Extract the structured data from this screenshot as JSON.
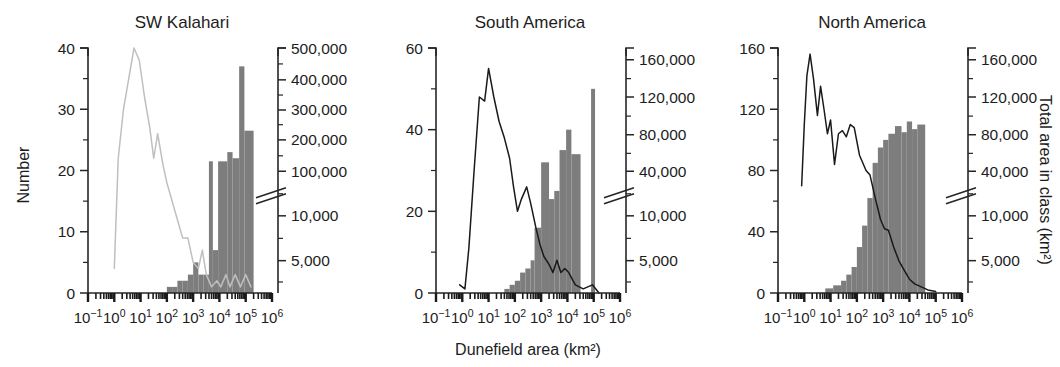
{
  "figure": {
    "xlabel": "Dunefield area (km²)",
    "ylabel_left": "Number",
    "ylabel_right": "Total area in class (km²)",
    "x_tick_labels": [
      "10⁻¹",
      "10⁰",
      "10¹",
      "10²",
      "10³",
      "10⁴",
      "10⁵",
      "10⁶"
    ],
    "x_tick_bases": [
      "10",
      "10",
      "10",
      "10",
      "10",
      "10",
      "10",
      "10"
    ],
    "x_tick_exponents": [
      "−1",
      "0",
      "1",
      "2",
      "3",
      "4",
      "5",
      "6"
    ],
    "x_range_log": [
      -1,
      6
    ],
    "colors": {
      "bar_fill": "#7d7d7d",
      "line_panel1": "#bfbfbf",
      "line_panel2": "#1a1a1a",
      "line_panel3": "#1a1a1a",
      "axis": "#262626",
      "text": "#1d1d1d"
    }
  },
  "chart_data": [
    {
      "type": "bar",
      "title": "SW Kalahari",
      "xlabel": "Dunefield area (km²)",
      "ylabel": "Number",
      "ylabel_right": "Total area in class (km²)",
      "x_log_scale": true,
      "xlim_log": [
        -1,
        6
      ],
      "ylim_left": [
        0,
        40
      ],
      "y_left_ticks": [
        0,
        10,
        20,
        30,
        40
      ],
      "y_left_minor_ticks": [
        5,
        15,
        25,
        35
      ],
      "y_right_labels": [
        "5,000",
        "10,000",
        "100,000",
        "200,000",
        "300,000",
        "400,000",
        "500,000"
      ],
      "y_right_values": [
        5000,
        10000,
        100000,
        200000,
        300000,
        400000,
        500000
      ],
      "axis_break_between": [
        "10,000",
        "100,000"
      ],
      "grid": false,
      "legend": "none",
      "bar_series_name": "Total area in class (km²)",
      "line_series_name": "Number",
      "bars_log_x": [
        {
          "x0": 2.0,
          "x1": 2.2,
          "value": 1
        },
        {
          "x0": 2.2,
          "x1": 2.4,
          "value": 1
        },
        {
          "x0": 2.4,
          "x1": 2.6,
          "value": 2
        },
        {
          "x0": 2.6,
          "x1": 2.8,
          "value": 2
        },
        {
          "x0": 2.8,
          "x1": 3.0,
          "value": 3
        },
        {
          "x0": 3.0,
          "x1": 3.2,
          "value": 5
        },
        {
          "x0": 3.2,
          "x1": 3.4,
          "value": 3
        },
        {
          "x0": 3.4,
          "x1": 3.6,
          "value": 3
        },
        {
          "x0": 3.6,
          "x1": 3.75,
          "value": 21.5
        },
        {
          "x0": 3.75,
          "x1": 3.95,
          "value": 7
        },
        {
          "x0": 3.95,
          "x1": 4.3,
          "value": 21.5
        },
        {
          "x0": 4.3,
          "x1": 4.5,
          "value": 23
        },
        {
          "x0": 4.5,
          "x1": 4.75,
          "value": 22
        },
        {
          "x0": 4.75,
          "x1": 4.95,
          "value": 37
        },
        {
          "x0": 4.95,
          "x1": 5.3,
          "value": 26.5
        }
      ],
      "line_points_log_x": [
        {
          "x": 0.0,
          "y": 4
        },
        {
          "x": 0.15,
          "y": 22
        },
        {
          "x": 0.35,
          "y": 30
        },
        {
          "x": 0.55,
          "y": 35
        },
        {
          "x": 0.75,
          "y": 40
        },
        {
          "x": 0.95,
          "y": 38
        },
        {
          "x": 1.15,
          "y": 32
        },
        {
          "x": 1.35,
          "y": 27
        },
        {
          "x": 1.5,
          "y": 22
        },
        {
          "x": 1.65,
          "y": 26
        },
        {
          "x": 1.85,
          "y": 21
        },
        {
          "x": 2.0,
          "y": 18
        },
        {
          "x": 2.2,
          "y": 15
        },
        {
          "x": 2.4,
          "y": 12
        },
        {
          "x": 2.6,
          "y": 9
        },
        {
          "x": 2.8,
          "y": 9
        },
        {
          "x": 3.0,
          "y": 5
        },
        {
          "x": 3.2,
          "y": 4
        },
        {
          "x": 3.35,
          "y": 7
        },
        {
          "x": 3.5,
          "y": 3
        },
        {
          "x": 3.7,
          "y": 1
        },
        {
          "x": 3.9,
          "y": 2
        },
        {
          "x": 4.05,
          "y": 1
        },
        {
          "x": 4.25,
          "y": 3
        },
        {
          "x": 4.4,
          "y": 1
        },
        {
          "x": 4.6,
          "y": 3
        },
        {
          "x": 4.8,
          "y": 1
        },
        {
          "x": 5.0,
          "y": 3
        },
        {
          "x": 5.2,
          "y": 1
        }
      ]
    },
    {
      "type": "bar",
      "title": "South America",
      "xlabel": "Dunefield area (km²)",
      "ylabel": "Number",
      "ylabel_right": "Total area in class (km²)",
      "x_log_scale": true,
      "xlim_log": [
        -1,
        6
      ],
      "ylim_left": [
        0,
        60
      ],
      "y_left_ticks": [
        0,
        20,
        40,
        60
      ],
      "y_left_minor_ticks": [
        10,
        30,
        50
      ],
      "y_right_labels": [
        "5,000",
        "10,000",
        "40,000",
        "80,000",
        "120,000",
        "160,000"
      ],
      "y_right_values": [
        5000,
        10000,
        40000,
        80000,
        120000,
        160000
      ],
      "axis_break_between": [
        "10,000",
        "40,000"
      ],
      "grid": false,
      "legend": "none",
      "bar_series_name": "Total area in class (km²)",
      "line_series_name": "Number",
      "bars_log_x": [
        {
          "x0": 1.6,
          "x1": 1.8,
          "value": 1
        },
        {
          "x0": 1.8,
          "x1": 2.0,
          "value": 2
        },
        {
          "x0": 2.0,
          "x1": 2.2,
          "value": 3
        },
        {
          "x0": 2.2,
          "x1": 2.4,
          "value": 5
        },
        {
          "x0": 2.4,
          "x1": 2.6,
          "value": 6
        },
        {
          "x0": 2.6,
          "x1": 2.75,
          "value": 8
        },
        {
          "x0": 2.75,
          "x1": 3.0,
          "value": 16
        },
        {
          "x0": 3.0,
          "x1": 3.3,
          "value": 32
        },
        {
          "x0": 3.3,
          "x1": 3.5,
          "value": 23
        },
        {
          "x0": 3.5,
          "x1": 3.7,
          "value": 25
        },
        {
          "x0": 3.7,
          "x1": 3.95,
          "value": 35
        },
        {
          "x0": 3.95,
          "x1": 4.15,
          "value": 40
        },
        {
          "x0": 4.15,
          "x1": 4.5,
          "value": 34
        },
        {
          "x0": 4.9,
          "x1": 5.05,
          "value": 50
        }
      ],
      "line_points_log_x": [
        {
          "x": -0.1,
          "y": 2
        },
        {
          "x": 0.1,
          "y": 1
        },
        {
          "x": 0.25,
          "y": 11
        },
        {
          "x": 0.45,
          "y": 30
        },
        {
          "x": 0.65,
          "y": 48
        },
        {
          "x": 0.85,
          "y": 47
        },
        {
          "x": 1.0,
          "y": 55
        },
        {
          "x": 1.2,
          "y": 48
        },
        {
          "x": 1.4,
          "y": 42
        },
        {
          "x": 1.6,
          "y": 38
        },
        {
          "x": 1.8,
          "y": 33
        },
        {
          "x": 1.95,
          "y": 26
        },
        {
          "x": 2.1,
          "y": 20
        },
        {
          "x": 2.25,
          "y": 23
        },
        {
          "x": 2.45,
          "y": 26
        },
        {
          "x": 2.6,
          "y": 22
        },
        {
          "x": 2.8,
          "y": 16
        },
        {
          "x": 2.95,
          "y": 12
        },
        {
          "x": 3.1,
          "y": 9
        },
        {
          "x": 3.3,
          "y": 7
        },
        {
          "x": 3.45,
          "y": 5
        },
        {
          "x": 3.6,
          "y": 8
        },
        {
          "x": 3.75,
          "y": 5
        },
        {
          "x": 3.9,
          "y": 6
        },
        {
          "x": 4.05,
          "y": 5
        },
        {
          "x": 4.3,
          "y": 2
        },
        {
          "x": 4.6,
          "y": 1
        },
        {
          "x": 4.95,
          "y": 2
        },
        {
          "x": 5.2,
          "y": 0
        }
      ]
    },
    {
      "type": "bar",
      "title": "North America",
      "xlabel": "Dunefield area (km²)",
      "ylabel": "Number",
      "ylabel_right": "Total area in class (km²)",
      "x_log_scale": true,
      "xlim_log": [
        -1,
        6
      ],
      "ylim_left": [
        0,
        160
      ],
      "y_left_ticks": [
        0,
        40,
        80,
        120,
        160
      ],
      "y_left_minor_ticks": [
        20,
        60,
        100,
        140
      ],
      "y_right_labels": [
        "5,000",
        "10,000",
        "40,000",
        "80,000",
        "120,000",
        "160,000"
      ],
      "y_right_values": [
        5000,
        10000,
        40000,
        80000,
        120000,
        160000
      ],
      "axis_break_between": [
        "10,000",
        "40,000"
      ],
      "grid": false,
      "legend": "none",
      "bar_series_name": "Total area in class (km²)",
      "line_series_name": "Number",
      "bars_log_x": [
        {
          "x0": 0.8,
          "x1": 1.1,
          "value": 3
        },
        {
          "x0": 1.1,
          "x1": 1.4,
          "value": 5
        },
        {
          "x0": 1.4,
          "x1": 1.6,
          "value": 8
        },
        {
          "x0": 1.6,
          "x1": 1.8,
          "value": 12
        },
        {
          "x0": 1.8,
          "x1": 2.0,
          "value": 17
        },
        {
          "x0": 2.0,
          "x1": 2.2,
          "value": 30
        },
        {
          "x0": 2.2,
          "x1": 2.4,
          "value": 44
        },
        {
          "x0": 2.4,
          "x1": 2.6,
          "value": 62
        },
        {
          "x0": 2.6,
          "x1": 2.8,
          "value": 85
        },
        {
          "x0": 2.8,
          "x1": 3.0,
          "value": 95
        },
        {
          "x0": 3.0,
          "x1": 3.2,
          "value": 100
        },
        {
          "x0": 3.2,
          "x1": 3.45,
          "value": 104
        },
        {
          "x0": 3.45,
          "x1": 3.7,
          "value": 109
        },
        {
          "x0": 3.7,
          "x1": 3.9,
          "value": 105
        },
        {
          "x0": 3.9,
          "x1": 4.1,
          "value": 112
        },
        {
          "x0": 4.1,
          "x1": 4.3,
          "value": 107
        },
        {
          "x0": 4.3,
          "x1": 4.6,
          "value": 110
        }
      ],
      "line_points_log_x": [
        {
          "x": -0.1,
          "y": 70
        },
        {
          "x": 0.0,
          "y": 110
        },
        {
          "x": 0.1,
          "y": 142
        },
        {
          "x": 0.22,
          "y": 156
        },
        {
          "x": 0.35,
          "y": 140
        },
        {
          "x": 0.5,
          "y": 116
        },
        {
          "x": 0.62,
          "y": 135
        },
        {
          "x": 0.75,
          "y": 120
        },
        {
          "x": 0.88,
          "y": 104
        },
        {
          "x": 1.0,
          "y": 113
        },
        {
          "x": 1.15,
          "y": 84
        },
        {
          "x": 1.3,
          "y": 104
        },
        {
          "x": 1.45,
          "y": 106
        },
        {
          "x": 1.6,
          "y": 102
        },
        {
          "x": 1.75,
          "y": 110
        },
        {
          "x": 1.9,
          "y": 108
        },
        {
          "x": 2.1,
          "y": 90
        },
        {
          "x": 2.35,
          "y": 80
        },
        {
          "x": 2.5,
          "y": 77
        },
        {
          "x": 2.7,
          "y": 62
        },
        {
          "x": 2.9,
          "y": 48
        },
        {
          "x": 3.05,
          "y": 42
        },
        {
          "x": 3.2,
          "y": 41
        },
        {
          "x": 3.4,
          "y": 30
        },
        {
          "x": 3.6,
          "y": 21
        },
        {
          "x": 3.8,
          "y": 15
        },
        {
          "x": 4.0,
          "y": 9
        },
        {
          "x": 4.2,
          "y": 6
        },
        {
          "x": 4.45,
          "y": 4
        },
        {
          "x": 4.7,
          "y": 2
        },
        {
          "x": 5.0,
          "y": 1
        }
      ]
    }
  ]
}
